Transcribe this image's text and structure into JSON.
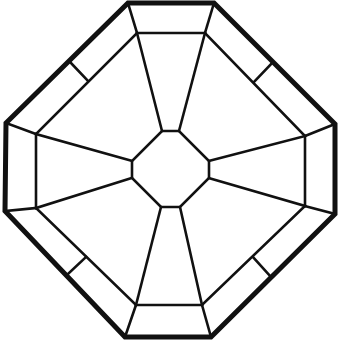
{
  "diagram": {
    "type": "octagonal-line-drawing",
    "stroke_color": "#111111",
    "background": "#ffffff",
    "outer_octagon": "128,3 214,3 335,124 335,214 211,337 125,337 5,211 6,123",
    "band_octagon": "137,33 205,33 305,136 305,206 202,305 136,305 36,208 36,134",
    "center_octagon": "162,131 179,131 209,161 209,178 180,207 161,207 132,178 132,161",
    "corner_connectors": [
      {
        "x1": 128,
        "y1": 3,
        "x2": 137,
        "y2": 33
      },
      {
        "x1": 214,
        "y1": 3,
        "x2": 205,
        "y2": 33
      },
      {
        "x1": 335,
        "y1": 124,
        "x2": 305,
        "y2": 136
      },
      {
        "x1": 335,
        "y1": 214,
        "x2": 305,
        "y2": 206
      },
      {
        "x1": 211,
        "y1": 337,
        "x2": 202,
        "y2": 305
      },
      {
        "x1": 125,
        "y1": 337,
        "x2": 136,
        "y2": 305
      },
      {
        "x1": 5,
        "y1": 211,
        "x2": 36,
        "y2": 208
      },
      {
        "x1": 6,
        "y1": 123,
        "x2": 36,
        "y2": 134
      }
    ],
    "radial_spokes": [
      {
        "x1": 137,
        "y1": 33,
        "x2": 162,
        "y2": 131
      },
      {
        "x1": 205,
        "y1": 33,
        "x2": 179,
        "y2": 131
      },
      {
        "x1": 305,
        "y1": 136,
        "x2": 209,
        "y2": 161
      },
      {
        "x1": 305,
        "y1": 206,
        "x2": 209,
        "y2": 178
      },
      {
        "x1": 202,
        "y1": 305,
        "x2": 180,
        "y2": 207
      },
      {
        "x1": 136,
        "y1": 305,
        "x2": 161,
        "y2": 207
      },
      {
        "x1": 36,
        "y1": 208,
        "x2": 132,
        "y2": 178
      },
      {
        "x1": 36,
        "y1": 134,
        "x2": 132,
        "y2": 161
      }
    ],
    "diagonal_ticks": [
      {
        "x1": 70,
        "y1": 62,
        "x2": 88,
        "y2": 81
      },
      {
        "x1": 272,
        "y1": 63,
        "x2": 254,
        "y2": 82
      },
      {
        "x1": 270,
        "y1": 276,
        "x2": 253,
        "y2": 257
      },
      {
        "x1": 68,
        "y1": 274,
        "x2": 86,
        "y2": 257
      }
    ]
  }
}
